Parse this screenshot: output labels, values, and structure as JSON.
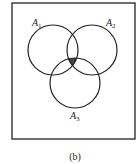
{
  "diagram": {
    "type": "venn",
    "sets": [
      {
        "name": "A",
        "sub": "1",
        "cx": 53,
        "cy": 50,
        "r": 25
      },
      {
        "name": "A",
        "sub": "2",
        "cx": 92,
        "cy": 50,
        "r": 25
      },
      {
        "name": "A",
        "sub": "3",
        "cx": 75,
        "cy": 83,
        "r": 25
      }
    ],
    "shaded_region": "A1 ∩ A2 ∩ A3",
    "shade_color": "#444444",
    "caption": "(b)"
  }
}
